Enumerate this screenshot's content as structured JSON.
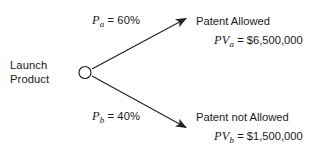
{
  "diagram": {
    "type": "decision-tree",
    "background_color": "#ffffff",
    "line_color": "#231f20",
    "text_color": "#1a1a1a",
    "root": {
      "label_line1": "Launch",
      "label_line2": "Product",
      "node_shape": "circle",
      "node_center_x": 85,
      "node_center_y": 72,
      "node_radius": 6
    },
    "branches": [
      {
        "id": "upper",
        "probability_var": "P",
        "probability_subscript": "a",
        "probability_equals": " = 60%",
        "probability_value": "60%",
        "outcome_title": "Patent Allowed",
        "value_var": "PV",
        "value_subscript": "a",
        "value_equals": " = $6,500,000",
        "value_amount": "$6,500,000",
        "arrow_start_x": 92,
        "arrow_start_y": 69,
        "arrow_end_x": 187,
        "arrow_end_y": 18
      },
      {
        "id": "lower",
        "probability_var": "P",
        "probability_subscript": "b",
        "probability_equals": " = 40%",
        "probability_value": "40%",
        "outcome_title": "Patent not Allowed",
        "value_var": "PV",
        "value_subscript": "b",
        "value_equals": " = $1,500,000",
        "value_amount": "$1,500,000",
        "arrow_start_x": 92,
        "arrow_start_y": 76,
        "arrow_end_x": 187,
        "arrow_end_y": 128
      }
    ]
  }
}
